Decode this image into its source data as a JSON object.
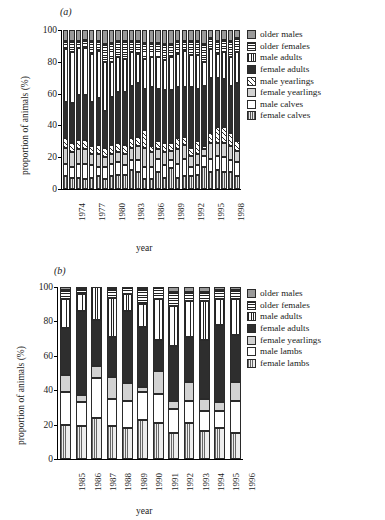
{
  "figure": {
    "xlabel": "year",
    "ylabel": "proportion of animals (%)"
  },
  "panels": [
    {
      "tag": "(a)",
      "label_a": "(a)"
    },
    {
      "tag": "(b)",
      "label_b": "(b)"
    }
  ],
  "panel_a": {
    "tag": "(a)",
    "ylabel": "proportion of animals (%)",
    "xlabel": "year",
    "yticks": [
      "0",
      "20",
      "40",
      "60",
      "80",
      "100"
    ],
    "xticks": [
      "1974",
      "1977",
      "1980",
      "1983",
      "1986",
      "1989",
      "1992",
      "1995",
      "1998"
    ],
    "legend": [
      {
        "key": "oldermales",
        "label": "older males"
      },
      {
        "key": "olderfemales",
        "label": "older females"
      },
      {
        "key": "maleadults",
        "label": "male adults"
      },
      {
        "key": "femaleadults",
        "label": "female adults"
      },
      {
        "key": "maleyearlings",
        "label": "male yearlings"
      },
      {
        "key": "femaleyearlings",
        "label": "female yearlings"
      },
      {
        "key": "malecalves",
        "label": "male calves"
      },
      {
        "key": "femalecalves",
        "label": "female calves"
      }
    ]
  },
  "panel_b": {
    "tag": "(b)",
    "ylabel": "proportion of animals (%)",
    "xlabel": "year",
    "yticks": [
      "0",
      "20",
      "40",
      "60",
      "80",
      "100"
    ],
    "xticks": [
      "1985",
      "1986",
      "1987",
      "1988",
      "1989",
      "1990",
      "1991",
      "1992",
      "1993",
      "1994",
      "1995",
      "1996"
    ],
    "legend": [
      {
        "key": "oldermales",
        "label": "older males"
      },
      {
        "key": "olderfemales",
        "label": "older females"
      },
      {
        "key": "maleadults",
        "label": "male adults"
      },
      {
        "key": "femaleadults",
        "label": "female adults"
      },
      {
        "key": "femaleyearlings",
        "label": "female yearlings"
      },
      {
        "key": "malelambs",
        "label": "male lambs"
      },
      {
        "key": "femalelambs",
        "label": "female lambs"
      }
    ]
  },
  "chart_data": [
    {
      "panel": "(a)",
      "type": "bar",
      "stacked": true,
      "title": "",
      "xlabel": "year",
      "ylabel": "proportion of animals (%)",
      "ylim": [
        0,
        100
      ],
      "yticks": [
        0,
        20,
        40,
        60,
        80,
        100
      ],
      "grid": false,
      "legend_position": "right",
      "categories": [
        1974,
        1975,
        1976,
        1977,
        1978,
        1979,
        1980,
        1981,
        1982,
        1983,
        1984,
        1985,
        1986,
        1987,
        1988,
        1989,
        1990,
        1991,
        1992,
        1993,
        1994,
        1995,
        1996,
        1997,
        1998,
        1999,
        2000
      ],
      "series": [
        {
          "name": "female calves",
          "values": [
            8,
            7,
            7,
            6,
            7,
            8,
            6,
            8,
            9,
            9,
            12,
            11,
            6,
            6,
            11,
            7,
            13,
            7,
            8,
            8,
            9,
            14,
            11,
            12,
            11,
            11,
            8
          ]
        },
        {
          "name": "male calves",
          "values": [
            8,
            7,
            9,
            10,
            8,
            6,
            8,
            8,
            8,
            6,
            6,
            7,
            8,
            8,
            8,
            8,
            5,
            9,
            11,
            6,
            6,
            7,
            8,
            9,
            9,
            7,
            9
          ]
        },
        {
          "name": "female yearlings",
          "values": [
            10,
            9,
            9,
            9,
            7,
            8,
            6,
            6,
            6,
            7,
            8,
            9,
            12,
            9,
            6,
            8,
            6,
            9,
            9,
            7,
            7,
            4,
            10,
            8,
            9,
            9,
            7
          ]
        },
        {
          "name": "male yearlings",
          "values": [
            6,
            6,
            6,
            6,
            5,
            6,
            6,
            6,
            6,
            6,
            6,
            6,
            11,
            4,
            5,
            6,
            5,
            7,
            5,
            5,
            8,
            2,
            6,
            10,
            10,
            8,
            6
          ]
        },
        {
          "name": "female adults",
          "values": [
            23,
            25,
            28,
            28,
            28,
            29,
            23,
            30,
            32,
            33,
            33,
            34,
            26,
            37,
            33,
            33,
            33,
            32,
            31,
            38,
            33,
            38,
            35,
            31,
            30,
            30,
            37
          ]
        },
        {
          "name": "male adults",
          "values": [
            33,
            32,
            30,
            30,
            30,
            30,
            31,
            22,
            22,
            21,
            21,
            18,
            19,
            19,
            20,
            19,
            21,
            21,
            23,
            20,
            21,
            15,
            18,
            15,
            17,
            18,
            19
          ]
        },
        {
          "name": "older females",
          "values": [
            5,
            7,
            4,
            5,
            8,
            6,
            11,
            12,
            10,
            11,
            7,
            8,
            10,
            9,
            9,
            10,
            8,
            8,
            6,
            9,
            9,
            11,
            7,
            8,
            8,
            10,
            9
          ]
        },
        {
          "name": "older males",
          "values": [
            7,
            7,
            7,
            6,
            7,
            7,
            9,
            8,
            7,
            7,
            7,
            7,
            8,
            8,
            8,
            9,
            9,
            7,
            7,
            7,
            7,
            9,
            5,
            7,
            6,
            7,
            5
          ]
        }
      ]
    },
    {
      "panel": "(b)",
      "type": "bar",
      "stacked": true,
      "title": "",
      "xlabel": "year",
      "ylabel": "proportion of animals (%)",
      "ylim": [
        0,
        100
      ],
      "yticks": [
        0,
        20,
        40,
        60,
        80,
        100
      ],
      "grid": false,
      "legend_position": "right",
      "categories": [
        1985,
        1986,
        1987,
        1988,
        1989,
        1990,
        1991,
        1992,
        1993,
        1994,
        1995,
        1996
      ],
      "series": [
        {
          "name": "female lambs",
          "values": [
            20,
            19,
            24,
            19,
            18,
            23,
            21,
            15,
            21,
            16,
            18,
            15
          ]
        },
        {
          "name": "male lambs",
          "values": [
            19,
            14,
            23,
            16,
            16,
            16,
            17,
            14,
            13,
            12,
            10,
            19
          ]
        },
        {
          "name": "female yearlings",
          "values": [
            10,
            4,
            7,
            13,
            10,
            3,
            13,
            5,
            11,
            7,
            5,
            11
          ]
        },
        {
          "name": "female adults",
          "values": [
            27,
            49,
            27,
            23,
            42,
            35,
            18,
            32,
            26,
            34,
            45,
            27
          ]
        },
        {
          "name": "male adults",
          "values": [
            17,
            10,
            19,
            23,
            10,
            13,
            24,
            23,
            21,
            23,
            15,
            21
          ]
        },
        {
          "name": "older females",
          "values": [
            5,
            3,
            0,
            5,
            4,
            9,
            7,
            8,
            5,
            5,
            5,
            5
          ]
        },
        {
          "name": "older males",
          "values": [
            2,
            1,
            0,
            1,
            0,
            1,
            0,
            3,
            3,
            3,
            2,
            2
          ]
        }
      ]
    }
  ]
}
